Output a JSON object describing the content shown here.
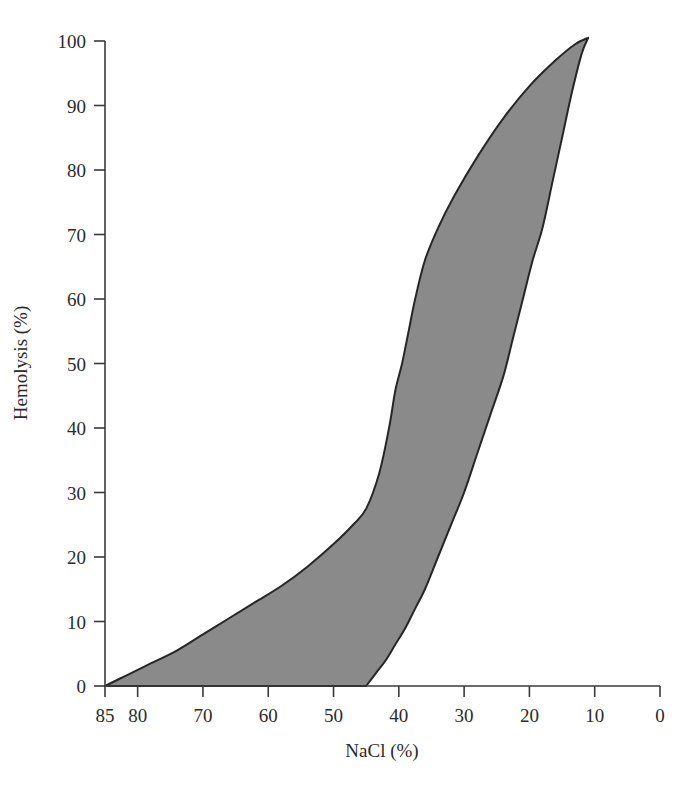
{
  "chart_data": {
    "type": "area",
    "title": "",
    "subtitle": "",
    "xlabel": "NaCl (%)",
    "ylabel": "Hemolysis (%)",
    "xlim": [
      85,
      0
    ],
    "ylim": [
      0,
      100
    ],
    "x_axis_reversed": true,
    "grid": false,
    "legend": null,
    "legend_position": "none",
    "annotations": [],
    "xticks": [
      85,
      80,
      70,
      60,
      50,
      40,
      30,
      20,
      10,
      0
    ],
    "xtick_labels": [
      "85",
      "80",
      "70",
      "60",
      "50",
      "40",
      "30",
      "20",
      "10",
      "0"
    ],
    "yticks": [
      0,
      10,
      20,
      30,
      40,
      50,
      60,
      70,
      80,
      90,
      100
    ],
    "ytick_labels": [
      "0",
      "10",
      "20",
      "30",
      "40",
      "50",
      "60",
      "70",
      "80",
      "90",
      "100"
    ],
    "series": [
      {
        "name": "upper-boundary",
        "description": "Onset / resistant-edge osmotic fragility curve (left boundary of shaded band)",
        "x": [
          85,
          82,
          78,
          74,
          70,
          66,
          62,
          58,
          54,
          50,
          47,
          45,
          43,
          41.5,
          40.5,
          39.5,
          38.5,
          37.5,
          36,
          34,
          31.5,
          28,
          24,
          20,
          16,
          13,
          11
        ],
        "y": [
          0,
          1.5,
          3.5,
          5.5,
          8,
          10.5,
          13,
          15.5,
          18.5,
          22,
          25,
          27.5,
          33,
          40,
          46,
          50,
          55,
          60,
          66,
          71,
          76,
          82,
          88,
          93,
          97,
          99.5,
          100.5
        ]
      },
      {
        "name": "lower-boundary",
        "description": "Completion / fragile-edge osmotic fragility curve (right boundary of shaded band)",
        "x": [
          45,
          43.5,
          42,
          40.5,
          39,
          37.5,
          36,
          34,
          32,
          30,
          28,
          26,
          24,
          22.5,
          21,
          19.5,
          18,
          16.5,
          15,
          13.5,
          12,
          11
        ],
        "y": [
          0,
          2,
          4,
          6.5,
          9,
          12,
          15,
          20,
          25,
          30,
          36,
          42,
          48,
          54,
          60,
          66,
          71,
          78,
          85,
          92,
          98,
          100.5
        ]
      }
    ],
    "fill_color": "#8a8a8a",
    "line_color": "#262626",
    "axis_color": "#3a3a3a"
  },
  "axes": {
    "x_title": "NaCl (%)",
    "y_title": "Hemolysis (%)"
  }
}
